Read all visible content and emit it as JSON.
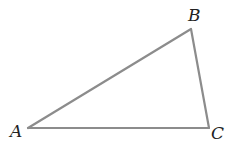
{
  "diagram": {
    "type": "triangle",
    "stroke_color": "#8c8c8c",
    "label_color": "#222222",
    "vertices": [
      {
        "name": "A",
        "x": 28,
        "y": 128
      },
      {
        "name": "B",
        "x": 191,
        "y": 29
      },
      {
        "name": "C",
        "x": 209,
        "y": 128
      }
    ],
    "labels": {
      "A": "A",
      "B": "B",
      "C": "C"
    },
    "edges": [
      "AB",
      "BC",
      "CA"
    ]
  }
}
